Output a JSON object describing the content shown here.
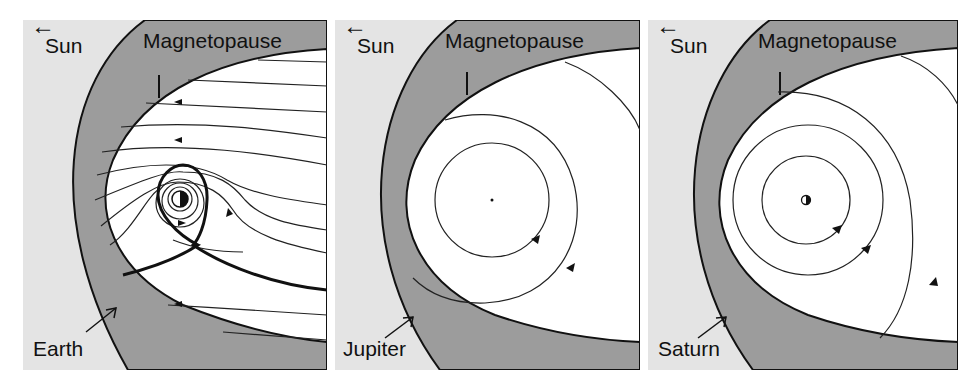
{
  "figure": {
    "colors": {
      "solar_wind_bg": "#e4e4e4",
      "magnetosheath": "#9c9c9c",
      "magnetosphere": "#ffffff",
      "lines": "#111111"
    },
    "panels": [
      {
        "planet": "Earth",
        "sun_label": "Sun",
        "sun_arrow": "←",
        "boundary_label": "Magnetopause",
        "planet_label": "Earth"
      },
      {
        "planet": "Jupiter",
        "sun_label": "Sun",
        "sun_arrow": "←",
        "boundary_label": "Magnetopause",
        "planet_label": "Jupiter"
      },
      {
        "planet": "Saturn",
        "sun_label": "Sun",
        "sun_arrow": "←",
        "boundary_label": "Magnetopause",
        "planet_label": "Saturn"
      }
    ]
  }
}
